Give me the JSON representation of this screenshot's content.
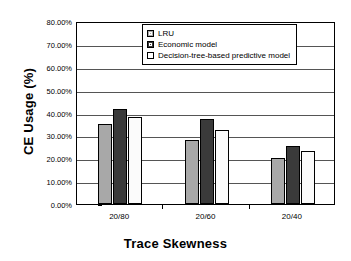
{
  "chart_data": {
    "type": "bar",
    "title": "",
    "xlabel": "Trace Skewness",
    "ylabel": "CE Usage (%)",
    "categories": [
      "20/80",
      "20/60",
      "20/40"
    ],
    "series": [
      {
        "name": "LRU",
        "values": [
          35.0,
          28.0,
          20.0
        ],
        "color": "#a8a8a8"
      },
      {
        "name": "Economic model",
        "values": [
          41.5,
          37.0,
          25.5
        ],
        "color": "#3a3a3a"
      },
      {
        "name": "Decision-tree-based predictive model",
        "values": [
          38.0,
          32.5,
          23.0
        ],
        "color": "#fbfbfb"
      }
    ],
    "ylim": [
      0,
      80
    ],
    "ytick_values": [
      0,
      10,
      20,
      30,
      40,
      50,
      60,
      70,
      80
    ],
    "ytick_labels": [
      "0.00%",
      "10.00%",
      "20.00%",
      "30.00%",
      "40.00%",
      "50.00%",
      "60.00%",
      "70.00%",
      "80.00%"
    ],
    "grid": true,
    "legend_position": "top-center"
  }
}
